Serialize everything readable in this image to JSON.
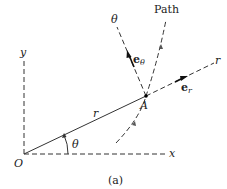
{
  "figure": {
    "caption": "(a)",
    "labels": {
      "path": "Path",
      "theta_axis": "θ",
      "r_axis": "r",
      "y_axis": "y",
      "x_axis": "x",
      "origin": "O",
      "point": "A",
      "radius": "r",
      "angle": "θ",
      "e_theta_base": "e",
      "e_theta_sub": "θ",
      "e_r_base": "e",
      "e_r_sub": "r"
    },
    "colors": {
      "stroke": "#333333",
      "background": "#ffffff"
    }
  }
}
